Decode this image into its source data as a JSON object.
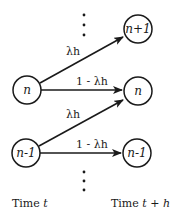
{
  "diagram": {
    "nodes": {
      "left_n": "n",
      "left_n_minus_1": "n-1",
      "right_n_plus_1": "n+1",
      "right_n": "n",
      "right_n_minus_1": "n-1"
    },
    "edges": {
      "n_to_n_plus_1": "λh",
      "n_to_n": "1 - λh",
      "n_minus_1_to_n": "λh",
      "n_minus_1_to_n_minus_1": "1 - λh"
    },
    "axis_labels": {
      "left_prefix": "Time ",
      "left_var": "t",
      "right_prefix": "Time ",
      "right_var": "t + h"
    },
    "colors": {
      "stroke": "#1a1a1a",
      "background": "#ffffff"
    }
  }
}
